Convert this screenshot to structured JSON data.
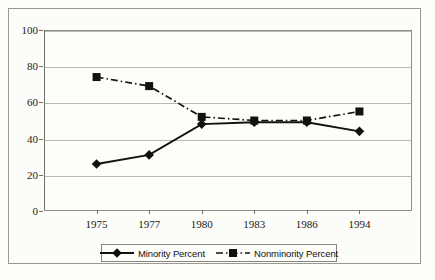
{
  "chart_data": {
    "type": "line",
    "title": "",
    "subtitle": "",
    "xlabel": "",
    "ylabel": "",
    "categories": [
      "1975",
      "1977",
      "1980",
      "1983",
      "1986",
      "1994"
    ],
    "series": [
      {
        "name": "Minority Percent",
        "values": [
          26,
          31,
          48,
          49,
          49,
          44
        ],
        "marker": "diamond",
        "line_style": "solid",
        "color": "#111110"
      },
      {
        "name": "Nonminority Percent",
        "values": [
          74,
          69,
          52,
          50,
          50,
          55
        ],
        "marker": "square",
        "line_style": "dash-dot",
        "color": "#111110"
      }
    ],
    "ylim": [
      0,
      100
    ],
    "yticks": [
      0,
      20,
      40,
      60,
      80,
      100
    ],
    "ytick_labels": [
      "0",
      "20",
      "40",
      "60",
      "80",
      "100"
    ],
    "grid": "horizontal",
    "legend_position": "bottom"
  },
  "axes": {
    "y_tick_labels": [
      "100",
      "80",
      "60",
      "40",
      "20",
      "0"
    ],
    "x_tick_labels": [
      "1975",
      "1977",
      "1980",
      "1983",
      "1986",
      "1994"
    ]
  },
  "legend": {
    "entries": [
      {
        "label": "Minority Percent"
      },
      {
        "label": "Nonminority Percent"
      }
    ]
  },
  "icons": {
    "diamond_marker": "diamond-marker-icon",
    "square_marker": "square-marker-icon"
  }
}
